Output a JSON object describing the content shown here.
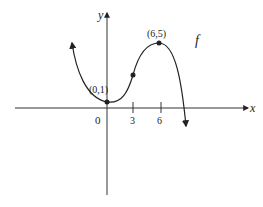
{
  "diagram": {
    "function_label": "f",
    "axes": {
      "x_label": "x",
      "y_label": "y"
    },
    "ticks": [
      {
        "label": "0",
        "value": 0
      },
      {
        "label": "3",
        "value": 3
      },
      {
        "label": "6",
        "value": 6
      }
    ],
    "points": [
      {
        "label": "(0,1)",
        "x": 0,
        "y": 1,
        "note": "local minimum"
      },
      {
        "label": "",
        "x": 3,
        "y": 3,
        "note": "inflection point"
      },
      {
        "label": "(6,5)",
        "x": 6,
        "y": 5,
        "note": "local maximum"
      }
    ],
    "colors": {
      "stroke": "#222222",
      "background": "#ffffff"
    }
  }
}
